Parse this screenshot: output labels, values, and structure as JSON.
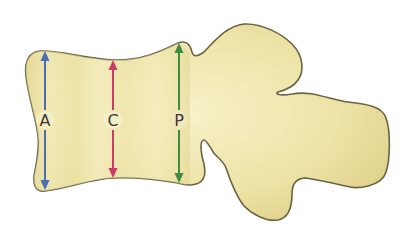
{
  "diagram": {
    "colors": {
      "body_fill": "#ede3a6",
      "body_fill_light": "#f7f1c8",
      "body_fill_dark": "#dccd86",
      "outline": "#6b6342",
      "background": "#ffffff"
    },
    "measurements": [
      {
        "id": "A",
        "label": "A",
        "color": "#4a6fb0",
        "x": 45,
        "y_top": 51,
        "y_bottom": 190,
        "label_y": 120
      },
      {
        "id": "C",
        "label": "C",
        "color": "#d0386a",
        "x": 113,
        "y_top": 60,
        "y_bottom": 178,
        "label_y": 120
      },
      {
        "id": "P",
        "label": "P",
        "color": "#3f8a45",
        "x": 179,
        "y_top": 43,
        "y_bottom": 183,
        "label_y": 120
      }
    ]
  }
}
